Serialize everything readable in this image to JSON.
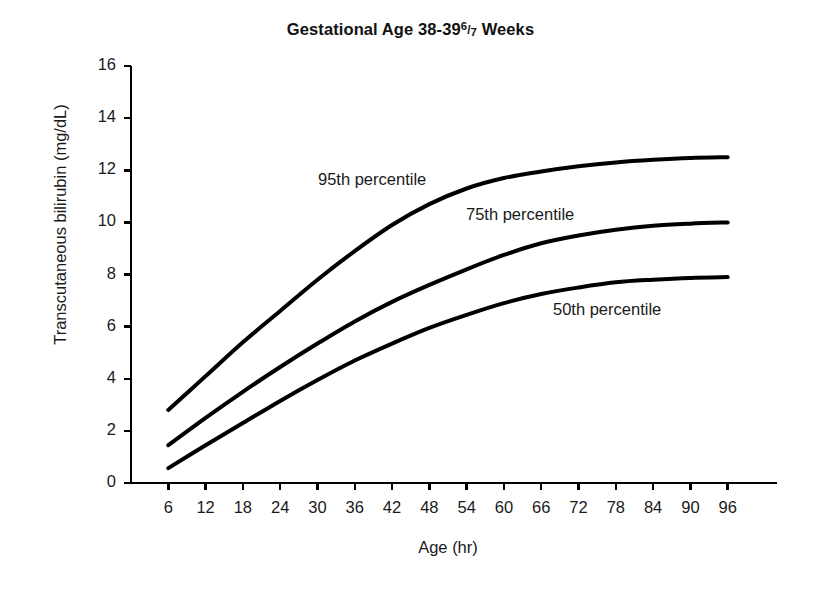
{
  "chart_data": {
    "type": "line",
    "title_prefix": "Gestational Age 38-39",
    "title_fraction_numerator": "6",
    "title_fraction_slash": "/",
    "title_fraction_denominator": "7",
    "title_suffix": "Weeks",
    "xlabel": "Age (hr)",
    "ylabel": "Transcutaneous bilirubin (mg/dL)",
    "xlim": [
      0,
      102
    ],
    "ylim": [
      0,
      16
    ],
    "xticks": [
      6,
      12,
      18,
      24,
      30,
      36,
      42,
      48,
      54,
      60,
      66,
      72,
      78,
      84,
      90,
      96
    ],
    "yticks": [
      0,
      2,
      4,
      6,
      8,
      10,
      12,
      14,
      16
    ],
    "xtick_labels": [
      "6",
      "12",
      "18",
      "24",
      "30",
      "36",
      "42",
      "48",
      "54",
      "60",
      "66",
      "72",
      "78",
      "84",
      "90",
      "96"
    ],
    "ytick_labels": [
      "0",
      "2",
      "4",
      "6",
      "8",
      "10",
      "12",
      "14",
      "16"
    ],
    "grid": false,
    "legend_position": "inline-annotations",
    "line_color": "#000000",
    "line_width_px": 4,
    "x": [
      6,
      12,
      18,
      24,
      30,
      36,
      42,
      48,
      54,
      60,
      66,
      72,
      78,
      84,
      90,
      96
    ],
    "series": [
      {
        "name": "95th percentile",
        "label": "95th percentile",
        "values": [
          2.8,
          4.1,
          5.4,
          6.6,
          7.8,
          8.9,
          9.9,
          10.7,
          11.3,
          11.7,
          11.95,
          12.15,
          12.3,
          12.4,
          12.47,
          12.5
        ],
        "annotation_x_px": 318,
        "annotation_y_px": 170
      },
      {
        "name": "75th percentile",
        "label": "75th percentile",
        "values": [
          1.45,
          2.5,
          3.5,
          4.45,
          5.35,
          6.2,
          6.95,
          7.6,
          8.2,
          8.75,
          9.2,
          9.5,
          9.72,
          9.87,
          9.95,
          10.0
        ],
        "annotation_x_px": 466,
        "annotation_y_px": 205
      },
      {
        "name": "50th percentile",
        "label": "50th percentile",
        "values": [
          0.57,
          1.45,
          2.3,
          3.15,
          3.95,
          4.7,
          5.35,
          5.95,
          6.45,
          6.9,
          7.25,
          7.5,
          7.7,
          7.8,
          7.87,
          7.9
        ],
        "annotation_x_px": 553,
        "annotation_y_px": 300
      }
    ],
    "axes_geometry_px": {
      "left": 131,
      "right": 765,
      "top": 66,
      "bottom": 483,
      "tick_length": 7,
      "axis_line_width": 2.5
    }
  }
}
